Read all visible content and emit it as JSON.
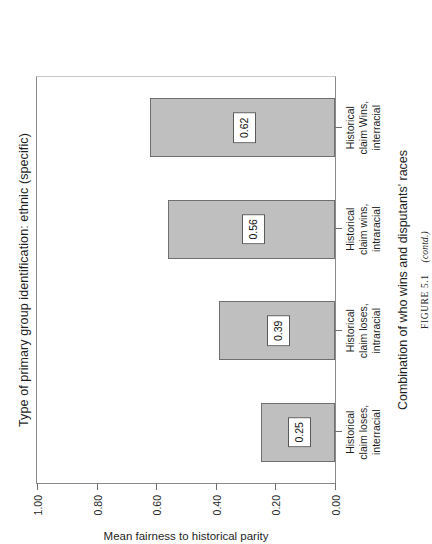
{
  "chart_data": {
    "type": "bar",
    "title": "Type of primary group identification: ethnic (specific)",
    "xlabel": "Combination of who wins and disputants' races",
    "ylabel": "Mean fairness to historical parity",
    "categories": [
      "Historical claim loses, interracial",
      "Historical claim loses, intraracial",
      "Historical claim wins, intraracial",
      "Historical claim Wins, interracial"
    ],
    "category_lines": [
      [
        "Historical",
        "claim loses,",
        "interracial"
      ],
      [
        "Historical",
        "claim loses,",
        "intraracial"
      ],
      [
        "Historical",
        "claim wins,",
        "intraracial"
      ],
      [
        "Historical",
        "claim Wins,",
        "interracial"
      ]
    ],
    "values": [
      0.25,
      0.39,
      0.56,
      0.62
    ],
    "value_labels": [
      "0.25",
      "0.39",
      "0.56",
      "0.62"
    ],
    "ylim": [
      0.0,
      1.0
    ],
    "yticks": [
      0.0,
      0.2,
      0.4,
      0.6,
      0.8,
      1.0
    ],
    "ytick_labels": [
      "0.00",
      "0.20",
      "0.40",
      "0.60",
      "0.80",
      "1.00"
    ],
    "grid": false,
    "legend": "none",
    "bar_color": "#bfbfbf",
    "bar_edge_color": "#6f6f6f"
  },
  "caption": {
    "figure_label": "FIGURE 5.1",
    "continued": "(contd.)"
  }
}
